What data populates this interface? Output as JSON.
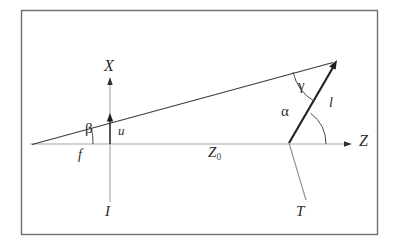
{
  "figure": {
    "kind": "geometric-diagram",
    "frame_color": "#6e6e6e",
    "line_color": "#3a3a3a",
    "axis_color": "#9a9a9a",
    "thick_line_color": "#1f1f1f",
    "background": "#ffffff"
  },
  "labels": {
    "axis_x": "X",
    "axis_z": "Z",
    "image_line": "I",
    "target_line": "T",
    "focal_length": "f",
    "object_height": "u",
    "length_l": "l",
    "distance_z0_main": "Z",
    "distance_z0_sub": "0",
    "angle_beta": "β",
    "angle_alpha": "α",
    "angle_gamma": "γ"
  },
  "geometry": {
    "frame": {
      "x": 21,
      "y": 10,
      "width": 357,
      "height": 225
    },
    "z_axis": {
      "x1": 30,
      "y1": 144,
      "x2": 352,
      "y2": 144
    },
    "x_axis": {
      "x": 110,
      "y_top": 78,
      "y_bottom": 202
    },
    "ray": {
      "x1": 32,
      "y1": 144,
      "x2": 337,
      "y2": 61
    },
    "target_line": {
      "x1": 337,
      "y1": 61,
      "x2": 306,
      "y2": 200
    },
    "u_vector": {
      "x": 110,
      "y_base": 144,
      "y_tip": 115
    },
    "vertex": {
      "x": 32,
      "y": 144
    },
    "z_crossing": {
      "x": 288,
      "y": 144
    },
    "apex": {
      "x": 337,
      "y": 61
    }
  },
  "label_positions": {
    "axis_x": {
      "left": 104,
      "top": 58,
      "size": 16
    },
    "axis_z": {
      "left": 359,
      "top": 133,
      "size": 16
    },
    "image_line": {
      "left": 105,
      "top": 205,
      "size": 15
    },
    "target_line": {
      "left": 296,
      "top": 205,
      "size": 15
    },
    "focal_length": {
      "left": 78,
      "top": 148,
      "size": 14
    },
    "object_height": {
      "left": 118,
      "top": 124,
      "size": 13
    },
    "length_l": {
      "left": 329,
      "top": 96,
      "size": 14
    },
    "distance_z0": {
      "left": 208,
      "top": 145,
      "size": 15
    },
    "angle_beta": {
      "left": 85,
      "top": 121,
      "size": 15
    },
    "angle_alpha": {
      "left": 281,
      "top": 104,
      "size": 15
    },
    "angle_gamma": {
      "left": 298,
      "top": 78,
      "size": 15
    }
  }
}
